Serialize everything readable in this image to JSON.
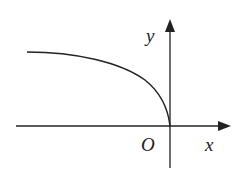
{
  "diagram": {
    "type": "function-graph",
    "labels": {
      "x_axis": "x",
      "y_axis": "y",
      "origin": "O"
    },
    "colors": {
      "stroke": "#222222",
      "background": "#ffffff"
    },
    "axes": {
      "origin_px": [
        170,
        126
      ],
      "x_axis": {
        "from_px": 16,
        "to_px": 231
      },
      "y_axis": {
        "from_px": 168,
        "to_px": 19
      }
    },
    "curve": {
      "shape": "concave, decreasing toward origin, vertical tangent at O",
      "start_px": [
        27,
        52
      ],
      "end_px": [
        170,
        126
      ]
    }
  }
}
